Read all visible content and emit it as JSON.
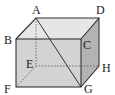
{
  "figure": {
    "type": "rectangular-prism",
    "vertices": {
      "A": "A",
      "B": "B",
      "C": "C",
      "D": "D",
      "E": "E",
      "F": "F",
      "G": "G",
      "H": "H"
    },
    "diagonal": "AG",
    "hidden_edges": [
      "AE",
      "EF",
      "EH"
    ],
    "colors": {
      "top_face": "#e4e4e4",
      "front_face": "#d2d2d2",
      "right_face": "#b4b4b4",
      "edge": "#333333"
    }
  }
}
